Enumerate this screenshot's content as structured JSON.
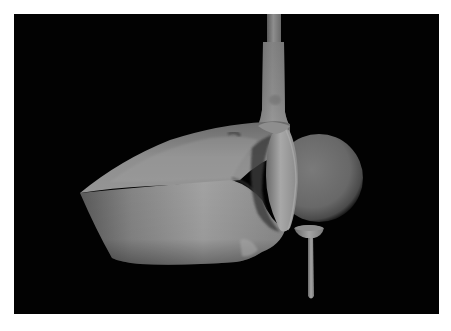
{
  "scene": {
    "description": "3D rendered golf driver club head striking a golf ball resting on a tee, grayscale, black background",
    "background_color": "#020202",
    "border_color": "#ffffff",
    "objects": [
      {
        "name": "club-shaft",
        "color": "#8a8a8a"
      },
      {
        "name": "club-head",
        "color": "#8c8c8c"
      },
      {
        "name": "club-face",
        "color": "#9a9a9a"
      },
      {
        "name": "golf-ball",
        "color": "#6e6e6e"
      },
      {
        "name": "tee",
        "color": "#9a9a9a"
      }
    ]
  }
}
